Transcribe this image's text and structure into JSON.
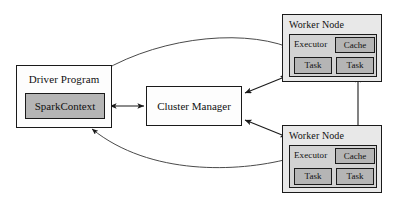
{
  "diagram": {
    "type": "block-architecture-diagram",
    "background": "#ffffff",
    "stroke": "#1a1a1a"
  },
  "driver": {
    "label": "Driver Program",
    "spark_context": {
      "label": "SparkContext"
    }
  },
  "cluster_manager": {
    "label": "Cluster Manager"
  },
  "workers": [
    {
      "label": "Worker Node",
      "executor": {
        "label": "Executor",
        "cache": {
          "label": "Cache"
        },
        "tasks": [
          {
            "label": "Task"
          },
          {
            "label": "Task"
          }
        ]
      }
    },
    {
      "label": "Worker Node",
      "executor": {
        "label": "Executor",
        "cache": {
          "label": "Cache"
        },
        "tasks": [
          {
            "label": "Task"
          },
          {
            "label": "Task"
          }
        ]
      }
    }
  ],
  "connections": [
    {
      "name": "sparkcontext-to-cluster-manager",
      "style": "straight",
      "heads": "both"
    },
    {
      "name": "sparkcontext-to-worker-1-executor",
      "style": "curved",
      "heads": "both"
    },
    {
      "name": "sparkcontext-to-worker-2-executor",
      "style": "curved",
      "heads": "both"
    },
    {
      "name": "cluster-manager-to-worker-1",
      "style": "straight",
      "heads": "both"
    },
    {
      "name": "cluster-manager-to-worker-2",
      "style": "straight",
      "heads": "both"
    },
    {
      "name": "worker-1-cache-to-worker-2-cache",
      "style": "straight",
      "heads": "both"
    }
  ],
  "palette": {
    "page_background": "#ffffff",
    "worker_fill": "#e8e8e8",
    "executor_fill": "#d2d2d2",
    "chip_fill": "#b5b5b5",
    "plain_fill": "#fdfdfd",
    "line": "#1a1a1a"
  }
}
